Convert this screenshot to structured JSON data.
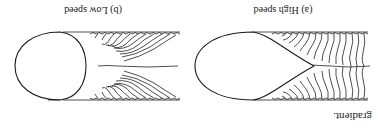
{
  "page": {
    "orientation": "rotated-180",
    "lead_text": "gradient.",
    "figures": [
      {
        "id": "a",
        "caption": "(a) High speed",
        "pool_shape": "teardrop"
      },
      {
        "id": "b",
        "caption": "(b) Low speed",
        "pool_shape": "elliptical"
      }
    ]
  }
}
